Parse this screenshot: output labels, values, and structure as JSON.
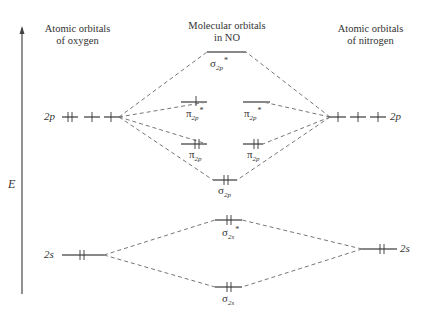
{
  "headers": {
    "left": [
      "Atomic orbitals",
      "of oxygen"
    ],
    "center": [
      "Molecular orbitals",
      "in NO"
    ],
    "right": [
      "Atomic orbitals",
      "of nitrogen"
    ]
  },
  "axis": {
    "label": "E",
    "direction": "up"
  },
  "oxygen": {
    "2p": {
      "label": "2p",
      "electrons": [
        2,
        1,
        1
      ]
    },
    "2s": {
      "label": "2s",
      "electrons": [
        2
      ]
    }
  },
  "nitrogen": {
    "2p": {
      "label": "2p",
      "electrons": [
        1,
        1,
        1
      ]
    },
    "2s": {
      "label": "2s",
      "electrons": [
        2
      ]
    }
  },
  "molecular_orbitals": [
    {
      "name": "sigma_2p_star",
      "symbol": "σ",
      "sub": "2p",
      "star": "*",
      "electrons": 0
    },
    {
      "name": "pi_2p_star_a",
      "symbol": "π",
      "sub": "2p",
      "star": "*",
      "electrons": 1
    },
    {
      "name": "pi_2p_star_b",
      "symbol": "π",
      "sub": "2p",
      "star": "*",
      "electrons": 0
    },
    {
      "name": "pi_2p_a",
      "symbol": "π",
      "sub": "2p",
      "star": "",
      "electrons": 2
    },
    {
      "name": "pi_2p_b",
      "symbol": "π",
      "sub": "2p",
      "star": "",
      "electrons": 2
    },
    {
      "name": "sigma_2p",
      "symbol": "σ",
      "sub": "2p",
      "star": "",
      "electrons": 2
    },
    {
      "name": "sigma_2s_star",
      "symbol": "σ",
      "sub": "2s",
      "star": "*",
      "electrons": 2
    },
    {
      "name": "sigma_2s",
      "symbol": "σ",
      "sub": "2s",
      "star": "",
      "electrons": 2
    }
  ],
  "colors": {
    "level": "#7a7a7a",
    "line": "#555555",
    "text": "#333333"
  }
}
